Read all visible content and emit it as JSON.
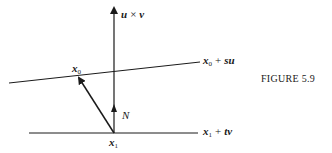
{
  "figure": {
    "caption": "FIGURE 5.9",
    "labels": {
      "cross_product": {
        "a": "u",
        "op": "×",
        "b": "v"
      },
      "upper_line": {
        "base": "x",
        "sub": "0",
        "op": "+",
        "param": "s",
        "dir": "u"
      },
      "lower_line": {
        "base": "x",
        "sub": "1",
        "op": "+",
        "param": "t",
        "dir": "v"
      },
      "point_x0": {
        "base": "x",
        "sub": "0"
      },
      "point_x1": {
        "base": "x",
        "sub": "1"
      },
      "normal": "N"
    },
    "colors": {
      "ink": "#1a1a1a",
      "background": "#ffffff"
    }
  }
}
